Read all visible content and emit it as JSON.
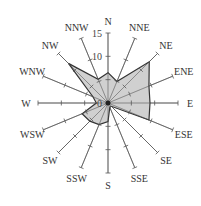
{
  "chart_data": {
    "type": "radar",
    "title": "",
    "categories": [
      "N",
      "NNE",
      "NE",
      "ENE",
      "E",
      "ESE",
      "SE",
      "SSE",
      "S",
      "SSW",
      "SW",
      "WSW",
      "W",
      "WNW",
      "NW",
      "NNW"
    ],
    "series": [
      {
        "name": "frequency",
        "values": [
          6.5,
          5,
          12.5,
          9.5,
          9,
          9.5,
          1,
          1,
          4,
          5,
          5.5,
          6,
          2.5,
          3.5,
          12,
          5.5
        ]
      }
    ],
    "radial_ticks": [
      0,
      5,
      10,
      15
    ],
    "radial_tick_labels": [
      "0",
      "10",
      "15"
    ],
    "rlim": [
      0,
      15
    ],
    "fill_color": "#c8c8c8",
    "line_color": "#333333"
  }
}
